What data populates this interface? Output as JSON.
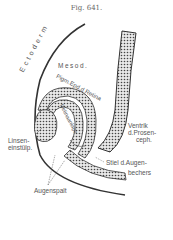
{
  "figure": {
    "title": "Fig. 641.",
    "labels": {
      "ectoderm": "Ectoderm",
      "mesoderm": "Mesod.",
      "pigment_epithelium": "Pigm.Epd.d.Retina",
      "retina_anlage": "Retinaanlage",
      "ventricle_line1": "Ventrik",
      "ventricle_line2": "d.Prosen-",
      "ventricle_line3": "ceph.",
      "lens_line1": "Linsen-",
      "lens_line2": "einstülp.",
      "stalk_line1": "Stiel d.Augen-",
      "stalk_line2": "bechers",
      "optic_fissure": "Augenspalt"
    }
  }
}
